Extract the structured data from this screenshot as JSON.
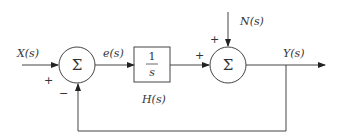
{
  "diagram": {
    "type": "feedback-control-block-diagram",
    "signals": {
      "input": "X(s)",
      "error": "e(s)",
      "disturbance": "N(s)",
      "output": "Y(s)"
    },
    "summing_junction_1": {
      "symbol": "Σ",
      "input_sign": "+",
      "feedback_sign": "−"
    },
    "block": {
      "numerator": "1",
      "denominator": "s",
      "name": "H(s)"
    },
    "summing_junction_2": {
      "symbol": "Σ",
      "top_sign": "+",
      "left_sign": "+"
    },
    "colors": {
      "line": "#444444",
      "text": "#333333",
      "background": "#ffffff"
    }
  }
}
